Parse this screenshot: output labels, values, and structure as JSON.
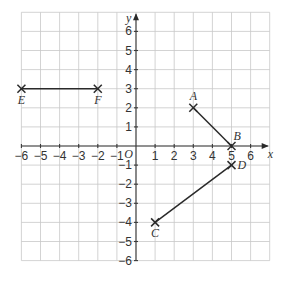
{
  "diagram": {
    "type": "coordinate-grid",
    "x_axis": {
      "label": "x",
      "min": -6,
      "max": 7,
      "ticks": [
        -6,
        -5,
        -4,
        -3,
        -2,
        -1,
        1,
        2,
        3,
        4,
        5,
        6
      ]
    },
    "y_axis": {
      "label": "y",
      "min": -6,
      "max": 7,
      "ticks": [
        6,
        5,
        4,
        3,
        2,
        1,
        -1,
        -2,
        -3,
        -4,
        -5,
        -6
      ]
    },
    "origin_label": "O",
    "tick_labels": {
      "x": [
        "−6",
        "−5",
        "−4",
        "−3",
        "−2",
        "−1",
        "1",
        "2",
        "3",
        "4",
        "5",
        "6"
      ],
      "y": [
        "6",
        "5",
        "4",
        "3",
        "2",
        "1",
        "−1",
        "−2",
        "−3",
        "−4",
        "−5",
        "−6"
      ]
    },
    "points": [
      {
        "name": "A",
        "x": 3,
        "y": 2
      },
      {
        "name": "B",
        "x": 5,
        "y": 0
      },
      {
        "name": "C",
        "x": 1,
        "y": -4
      },
      {
        "name": "D",
        "x": 5,
        "y": -1
      },
      {
        "name": "E",
        "x": -6,
        "y": 3
      },
      {
        "name": "F",
        "x": -2,
        "y": 3
      }
    ],
    "segments": [
      {
        "from": "A",
        "to": "B"
      },
      {
        "from": "C",
        "to": "D"
      },
      {
        "from": "E",
        "to": "F"
      }
    ],
    "colors": {
      "grid": "#c8c8c8",
      "axis": "#3a3a3a",
      "ink": "#2a2a2a",
      "text": "#333333"
    }
  }
}
